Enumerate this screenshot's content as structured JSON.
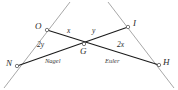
{
  "figure": {
    "colors": {
      "segment": "#1a1a1a",
      "ray": "#a8a8a8",
      "label": "#2b2b2b",
      "background": "#ffffff",
      "vertex_marker": "#6b6b6b"
    },
    "points": [
      {
        "id": "N",
        "label": "N",
        "x": 17,
        "y": 66,
        "label_x": 6,
        "label_y": 59
      },
      {
        "id": "H",
        "label": "H",
        "x": 159,
        "y": 65,
        "label_x": 163,
        "label_y": 58
      },
      {
        "id": "O",
        "label": "O",
        "x": 47,
        "y": 30,
        "label_x": 35,
        "label_y": 22
      },
      {
        "id": "I",
        "label": "I",
        "x": 128,
        "y": 27,
        "label_x": 133,
        "label_y": 19
      },
      {
        "id": "G",
        "label": "G",
        "x": 84,
        "y": 44,
        "label_x": 80,
        "label_y": 47
      }
    ],
    "segments": [
      {
        "name": "segment-N-to-I",
        "from": "N",
        "to": "I",
        "style": "solid-dark"
      },
      {
        "name": "segment-O-to-H",
        "from": "O",
        "to": "H",
        "style": "solid-dark"
      }
    ],
    "rays": [
      {
        "name": "ray-through-N-and-O",
        "x1": 4,
        "y1": 88,
        "x2": 70,
        "y2": 2,
        "style": "gray"
      },
      {
        "name": "ray-through-I-and-H",
        "x1": 108,
        "y1": 2,
        "x2": 174,
        "y2": 88,
        "style": "gray"
      }
    ],
    "angle_labels": [
      {
        "id": "angle-2y-at-N",
        "text": "2y",
        "x": 37,
        "y": 41
      },
      {
        "id": "angle-2x-at-H",
        "text": "2x",
        "x": 117,
        "y": 41
      },
      {
        "id": "angle-x-at-G",
        "text": "x",
        "x": 67,
        "y": 27
      },
      {
        "id": "angle-y-at-G",
        "text": "y",
        "x": 92,
        "y": 27
      }
    ],
    "line_names": [
      {
        "id": "nagel-line-label",
        "text": "Nagel",
        "x": 45,
        "y": 58
      },
      {
        "id": "euler-line-label",
        "text": "Euler",
        "x": 105,
        "y": 58
      }
    ]
  }
}
